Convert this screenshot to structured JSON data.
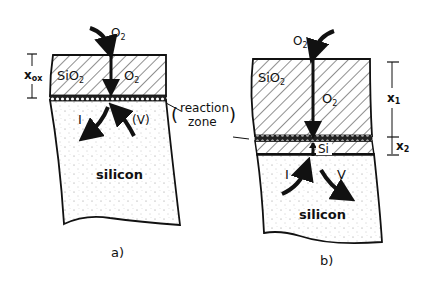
{
  "diagram": {
    "type": "schematic",
    "colors": {
      "ink": "#111111",
      "background": "#ffffff",
      "silicon_fill": "#f7f7f7"
    },
    "panels": [
      {
        "id": "a",
        "caption": "a)",
        "layers": [
          "SiO2",
          "reaction zone",
          "silicon"
        ],
        "labels": {
          "gas": "O2",
          "oxide": "SiO2",
          "oxide_diffusant": "O2",
          "interstitial": "I",
          "vacancy": "(V)",
          "substrate": "silicon",
          "thickness_symbol": "x",
          "thickness_sub": "ox"
        }
      },
      {
        "id": "b",
        "caption": "b)",
        "layers": [
          "SiO2",
          "reaction zone",
          "Si (between)",
          "silicon"
        ],
        "labels": {
          "gas": "O2",
          "oxide": "SiO2",
          "oxide_diffusant": "O2",
          "thin_layer": "Si",
          "interstitial": "I",
          "vacancy": "V",
          "substrate": "silicon",
          "x1_symbol": "x",
          "x1_sub": "1",
          "x2_symbol": "x",
          "x2_sub": "2"
        }
      }
    ],
    "shared_label": {
      "line1": "reaction",
      "line2": "zone"
    }
  }
}
